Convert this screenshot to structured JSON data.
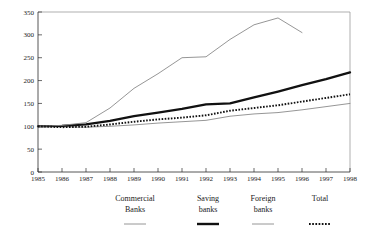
{
  "chart_data": {
    "type": "line",
    "title": "",
    "xlabel": "",
    "ylabel": "",
    "grid": false,
    "legend_position": "bottom",
    "xlim": [
      1985,
      1998
    ],
    "ylim": [
      0,
      350
    ],
    "yticks": [
      0,
      50,
      100,
      150,
      200,
      250,
      300,
      350
    ],
    "ytick_labels": [
      "0",
      "50",
      "100",
      "150",
      "200",
      "250",
      "300",
      "350"
    ],
    "x": [
      1985,
      1986,
      1987,
      1988,
      1989,
      1990,
      1991,
      1992,
      1993,
      1994,
      1995,
      1996,
      1997,
      1998
    ],
    "xtick_labels": [
      "1985",
      "1986",
      "1987",
      "1988",
      "1989",
      "1990",
      "1991",
      "1992",
      "1993",
      "1994",
      "1995",
      "1996",
      "1997",
      "1998"
    ],
    "series": [
      {
        "name": "Commercial Banks",
        "style": "thin-line",
        "color": "#8a8a8a",
        "values": [
          100,
          99,
          98,
          100,
          103,
          107,
          110,
          113,
          122,
          127,
          130,
          136,
          143,
          150
        ]
      },
      {
        "name": "Saving banks",
        "style": "thick-line",
        "color": "#111111",
        "values": [
          100,
          101,
          104,
          112,
          122,
          130,
          138,
          148,
          150,
          163,
          176,
          190,
          203,
          218
        ]
      },
      {
        "name": "Foreign banks",
        "style": "thin-line",
        "color": "#8a8a8a",
        "values": [
          100,
          102,
          108,
          140,
          183,
          215,
          250,
          252,
          290,
          322,
          337,
          305,
          null,
          null
        ]
      },
      {
        "name": "Total",
        "style": "dotted-line",
        "color": "#111111",
        "values": [
          100,
          98,
          99,
          104,
          110,
          115,
          119,
          124,
          134,
          140,
          146,
          154,
          162,
          170
        ]
      }
    ]
  },
  "legend": {
    "entries": [
      {
        "line1": "Commercial",
        "line2": "Banks",
        "style": "thin-line"
      },
      {
        "line1": "Saving",
        "line2": "banks",
        "style": "thick-line"
      },
      {
        "line1": "Foreign",
        "line2": "banks",
        "style": "thin-line"
      },
      {
        "line1": "Total",
        "line2": "",
        "style": "dotted-line"
      }
    ]
  }
}
